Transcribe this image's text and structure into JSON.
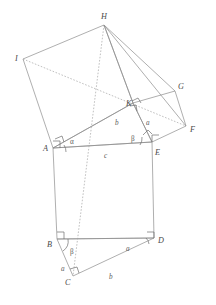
{
  "figure": {
    "stroke_color": "#8c8c8c",
    "dash_color": "#a5a5a5",
    "label_color": "#4a4a4a",
    "background": "#ffffff"
  },
  "vertices": [
    {
      "id": "H",
      "label": "H",
      "x": 104,
      "y": 25,
      "label_x": 101,
      "label_y": 19
    },
    {
      "id": "I",
      "label": "I",
      "x": 23,
      "y": 59,
      "label_x": 15,
      "label_y": 61
    },
    {
      "id": "G",
      "label": "G",
      "x": 175,
      "y": 91,
      "label_x": 178,
      "label_y": 89
    },
    {
      "id": "K",
      "label": "K",
      "x": 133,
      "y": 103,
      "label_x": 128,
      "label_y": 105
    },
    {
      "id": "F",
      "label": "F",
      "x": 186,
      "y": 126,
      "label_x": 190,
      "label_y": 132
    },
    {
      "id": "A",
      "label": "A",
      "x": 53,
      "y": 148,
      "label_x": 44,
      "label_y": 150
    },
    {
      "id": "E",
      "label": "E",
      "x": 152,
      "y": 142,
      "label_x": 156,
      "label_y": 154
    },
    {
      "id": "B",
      "label": "B",
      "x": 57,
      "y": 239,
      "label_x": 48,
      "label_y": 246
    },
    {
      "id": "D",
      "label": "D",
      "x": 154,
      "y": 238,
      "label_x": 158,
      "label_y": 242
    },
    {
      "id": "C",
      "label": "C",
      "x": 73,
      "y": 276,
      "label_x": 66,
      "label_y": 284
    }
  ],
  "side_labels": [
    {
      "id": "alpha-A",
      "text": "α",
      "x": 70,
      "y": 143
    },
    {
      "id": "b-upper",
      "text": "b",
      "x": 116,
      "y": 124
    },
    {
      "id": "a-upper",
      "text": "a",
      "x": 147,
      "y": 124
    },
    {
      "id": "beta-E",
      "text": "β",
      "x": 133,
      "y": 139
    },
    {
      "id": "c-middle",
      "text": "c",
      "x": 105,
      "y": 156
    },
    {
      "id": "beta-B",
      "text": "β",
      "x": 72,
      "y": 252
    },
    {
      "id": "a-left",
      "text": "a",
      "x": 62,
      "y": 269
    },
    {
      "id": "a-right",
      "text": "a",
      "x": 127,
      "y": 249
    },
    {
      "id": "b-bottom",
      "text": "b",
      "x": 110,
      "y": 277
    }
  ],
  "shapes": {
    "square_c": {
      "name": "square-on-hypotenuse",
      "points": "53,148 152,142 154,238 57,239"
    },
    "square_b": {
      "name": "square-on-side-b",
      "points": "53,148 23,59 104,25 133,103"
    },
    "square_a": {
      "name": "square-on-side-a",
      "points": "152,142 133,103 175,91 186,126"
    },
    "triangle_lower": {
      "name": "triangle-BCD",
      "points": "57,239 73,276 154,238"
    },
    "triangle_upper": {
      "name": "triangle-AKE",
      "points": "53,148 133,103 152,142"
    }
  },
  "dashed_lines": [
    {
      "name": "dash-I-to-F",
      "x1": 23,
      "y1": 59,
      "x2": 186,
      "y2": 126
    },
    {
      "name": "dash-H-to-C",
      "x1": 104,
      "y1": 25,
      "x2": 73,
      "y2": 276
    }
  ],
  "solid_lines": [
    {
      "name": "line-H-to-K",
      "x1": 104,
      "y1": 25,
      "x2": 133,
      "y2": 103
    },
    {
      "name": "line-H-to-G",
      "x1": 104,
      "y1": 25,
      "x2": 175,
      "y2": 91
    },
    {
      "name": "line-H-to-F",
      "x1": 104,
      "y1": 25,
      "x2": 186,
      "y2": 126
    }
  ],
  "right_angle_marks": [
    {
      "name": "right-angle-A",
      "x": 53,
      "y": 148
    },
    {
      "name": "right-angle-A2",
      "x": 57,
      "y": 142
    },
    {
      "name": "right-angle-E",
      "x": 152,
      "y": 142
    },
    {
      "name": "right-angle-E2",
      "x": 147,
      "y": 137
    },
    {
      "name": "right-angle-K1",
      "x": 133,
      "y": 103
    },
    {
      "name": "right-angle-K2",
      "x": 136,
      "y": 99
    },
    {
      "name": "right-angle-B",
      "x": 57,
      "y": 239
    },
    {
      "name": "right-angle-D",
      "x": 154,
      "y": 238
    },
    {
      "name": "right-angle-C",
      "x": 73,
      "y": 276
    }
  ]
}
